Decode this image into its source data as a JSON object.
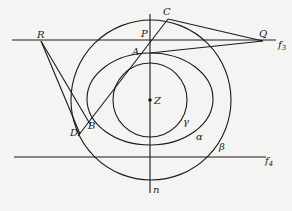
{
  "diagram": {
    "points": {
      "R": "R",
      "Q": "Q",
      "C": "C",
      "P": "P",
      "A": "A",
      "B": "B",
      "D": "D",
      "Z": "Z"
    },
    "lines": {
      "f3": "f",
      "f3_sub": "3",
      "f4": "f",
      "f4_sub": "4",
      "n": "n"
    },
    "curves": {
      "alpha": "α",
      "beta": "β",
      "gamma": "γ"
    },
    "colors": {
      "ink": "#1a1a1a",
      "paper": "#f4f4f2"
    }
  }
}
